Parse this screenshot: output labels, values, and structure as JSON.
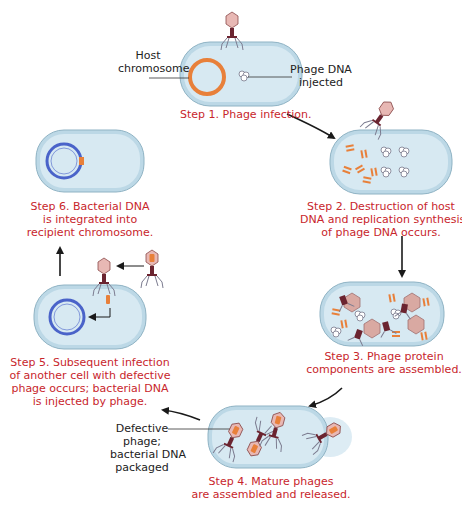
{
  "colors": {
    "caption": "#c8262c",
    "label": "#222222",
    "cell_fill": "#d7e9f2",
    "cell_rim": "#bcd8e6",
    "cell_outline": "#8fb3c4",
    "host_chromosome": "#e8803a",
    "recipient_chromosome": "#4a63c9",
    "phage_head": "#e8b8b4",
    "phage_tail": "#6b2430",
    "arrow": "#1a1a1a"
  },
  "steps": [
    {
      "id": 1,
      "caption_lines": [
        "Step 1. Phage infection."
      ]
    },
    {
      "id": 2,
      "caption_lines": [
        "Step 2. Destruction of host",
        "DNA and replication synthesis",
        "of phage DNA occurs."
      ]
    },
    {
      "id": 3,
      "caption_lines": [
        "Step 3. Phage protein",
        "components are assembled."
      ]
    },
    {
      "id": 4,
      "caption_lines": [
        "Step 4. Mature phages",
        "are assembled and released."
      ]
    },
    {
      "id": 5,
      "caption_lines": [
        "Step 5. Subsequent infection",
        "of another cell with defective",
        "phage occurs; bacterial DNA",
        "is injected by phage."
      ]
    },
    {
      "id": 6,
      "caption_lines": [
        "Step 6. Bacterial DNA",
        "is integrated into",
        "recipient chromosome."
      ]
    }
  ],
  "labels": {
    "host_chromosome": [
      "Host",
      "chromosome"
    ],
    "phage_dna_injected": [
      "Phage DNA",
      "injected"
    ],
    "defective_phage": [
      "Defective",
      "phage;",
      "bacterial DNA",
      "packaged"
    ]
  }
}
